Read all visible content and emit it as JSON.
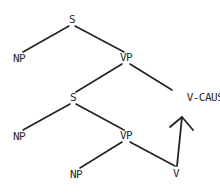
{
  "diagram": {
    "type": "syntax-tree",
    "line_color": "#222222",
    "nodes": [
      {
        "id": "s1",
        "label": "S",
        "x": 72,
        "y": 20
      },
      {
        "id": "np1",
        "label": "NP",
        "x": 19,
        "y": 59
      },
      {
        "id": "vp1",
        "label": "VP",
        "x": 126,
        "y": 58
      },
      {
        "id": "s2",
        "label": "S",
        "x": 73,
        "y": 98
      },
      {
        "id": "vcaus",
        "label": "V-CAUS",
        "x": 205,
        "y": 98
      },
      {
        "id": "np2",
        "label": "NP",
        "x": 19,
        "y": 137
      },
      {
        "id": "vp2",
        "label": "VP",
        "x": 126,
        "y": 136
      },
      {
        "id": "np3",
        "label": "NP",
        "x": 76,
        "y": 175
      },
      {
        "id": "v",
        "label": "V",
        "x": 176,
        "y": 174
      }
    ],
    "edges": [
      {
        "from": "s1",
        "to": "np1",
        "x1": 69,
        "y1": 26,
        "x2": 23,
        "y2": 52
      },
      {
        "from": "s1",
        "to": "vp1",
        "x1": 75,
        "y1": 26,
        "x2": 124,
        "y2": 52
      },
      {
        "from": "vp1",
        "to": "s2",
        "x1": 122,
        "y1": 64,
        "x2": 76,
        "y2": 92
      },
      {
        "from": "vp1",
        "to": "vcaus",
        "x1": 130,
        "y1": 64,
        "x2": 172,
        "y2": 90
      },
      {
        "from": "s2",
        "to": "np2",
        "x1": 70,
        "y1": 104,
        "x2": 23,
        "y2": 130
      },
      {
        "from": "s2",
        "to": "vp2",
        "x1": 76,
        "y1": 104,
        "x2": 124,
        "y2": 130
      },
      {
        "from": "vp2",
        "to": "np3",
        "x1": 122,
        "y1": 142,
        "x2": 80,
        "y2": 168
      },
      {
        "from": "vp2",
        "to": "v",
        "x1": 130,
        "y1": 142,
        "x2": 175,
        "y2": 166
      }
    ],
    "arrow": {
      "from": "v",
      "to": "vcaus",
      "x1": 177,
      "y1": 166,
      "x2": 182,
      "y2": 117,
      "head_left": {
        "x": 170,
        "y": 127
      },
      "head_right": {
        "x": 193,
        "y": 130
      }
    }
  }
}
